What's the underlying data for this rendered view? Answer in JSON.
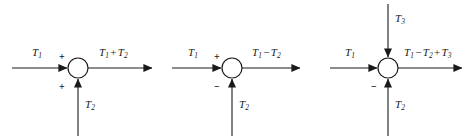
{
  "figure": {
    "type": "block-diagram",
    "background_color": "#ffffff",
    "line_color": "#1a1a1a",
    "text_color": "#1a1a1a"
  },
  "diagrams": [
    {
      "id": "diagram-1",
      "junction": {
        "cx": 78,
        "cy": 68,
        "r": 10
      },
      "inputs": [
        {
          "name": "left-input",
          "label_text": "T",
          "label_sub": "1",
          "sign": "+",
          "direction": "right"
        },
        {
          "name": "bottom-input",
          "label_text": "T",
          "label_sub": "2",
          "sign": "+",
          "direction": "up"
        }
      ],
      "output": {
        "name": "output",
        "terms": [
          {
            "op": "",
            "sym": "T",
            "sub": "1"
          },
          {
            "op": "+",
            "sym": "T",
            "sub": "2"
          }
        ],
        "plain": "T1 + T2"
      }
    },
    {
      "id": "diagram-2",
      "junction": {
        "cx": 232,
        "cy": 68,
        "r": 10
      },
      "inputs": [
        {
          "name": "left-input",
          "label_text": "T",
          "label_sub": "1",
          "sign": "+",
          "direction": "right"
        },
        {
          "name": "bottom-input",
          "label_text": "T",
          "label_sub": "2",
          "sign": "−",
          "direction": "up"
        }
      ],
      "output": {
        "name": "output",
        "terms": [
          {
            "op": "",
            "sym": "T",
            "sub": "1"
          },
          {
            "op": "−",
            "sym": "T",
            "sub": "2"
          }
        ],
        "plain": "T1 − T2"
      }
    },
    {
      "id": "diagram-3",
      "junction": {
        "cx": 388,
        "cy": 68,
        "r": 10
      },
      "inputs": [
        {
          "name": "left-input",
          "label_text": "T",
          "label_sub": "1",
          "sign": "",
          "direction": "right"
        },
        {
          "name": "top-input",
          "label_text": "T",
          "label_sub": "3",
          "sign": "",
          "direction": "down"
        },
        {
          "name": "bottom-input",
          "label_text": "T",
          "label_sub": "2",
          "sign": "−",
          "direction": "up"
        }
      ],
      "output": {
        "name": "output",
        "terms": [
          {
            "op": "",
            "sym": "T",
            "sub": "1"
          },
          {
            "op": "−",
            "sym": "T",
            "sub": "2"
          },
          {
            "op": "+",
            "sym": "T",
            "sub": "3"
          }
        ],
        "plain": "T1 − T2 + T3"
      }
    }
  ],
  "labels": {
    "d1_in_left": {
      "sym": "T",
      "sub": "1"
    },
    "d1_in_bottom": {
      "sym": "T",
      "sub": "2"
    },
    "d1_sign_left": "+",
    "d1_sign_bottom": "+",
    "d1_out_t1_sym": "T",
    "d1_out_t1_sub": "1",
    "d1_out_op": "+",
    "d1_out_t2_sym": "T",
    "d1_out_t2_sub": "2",
    "d2_in_left": {
      "sym": "T",
      "sub": "1"
    },
    "d2_in_bottom": {
      "sym": "T",
      "sub": "2"
    },
    "d2_sign_left": "+",
    "d2_sign_bottom": "−",
    "d2_out_t1_sym": "T",
    "d2_out_t1_sub": "1",
    "d2_out_op": "−",
    "d2_out_t2_sym": "T",
    "d2_out_t2_sub": "2",
    "d3_in_left": {
      "sym": "T",
      "sub": "1"
    },
    "d3_in_top": {
      "sym": "T",
      "sub": "3"
    },
    "d3_in_bottom": {
      "sym": "T",
      "sub": "2"
    },
    "d3_sign_bottom": "−",
    "d3_out_t1_sym": "T",
    "d3_out_t1_sub": "1",
    "d3_out_op1": "−",
    "d3_out_t2_sym": "T",
    "d3_out_t2_sub": "2",
    "d3_out_op2": "+",
    "d3_out_t3_sym": "T",
    "d3_out_t3_sub": "3"
  }
}
